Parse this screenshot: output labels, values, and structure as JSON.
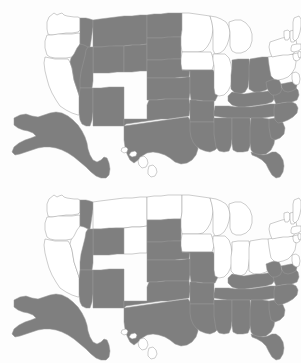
{
  "figure": {
    "type": "choropleth-pair",
    "title": "",
    "background_color": "#fdfdfd",
    "panel_count": 2
  },
  "colors": {
    "shaded": "#7f7f7f",
    "unshaded": "#ffffff",
    "border": "#9a9a9a",
    "background": "#fdfdfd"
  },
  "chart_data": {
    "type": "heatmap",
    "title": "",
    "subtitle": "",
    "xlabel": "",
    "ylabel": "",
    "legend": [],
    "annotations": [],
    "grid": false,
    "maps": [
      {
        "panel": "top",
        "label": "",
        "value_scale": [
          "unshaded",
          "shaded"
        ],
        "shaded_count": 32,
        "unshaded_count": 18,
        "states": {
          "AL": 1,
          "AK": 1,
          "AZ": 1,
          "AR": 1,
          "CA": 0,
          "CO": 1,
          "CT": 0,
          "DE": 0,
          "FL": 1,
          "GA": 1,
          "HI": 0,
          "ID": 1,
          "IL": 0,
          "IN": 1,
          "IA": 0,
          "KS": 1,
          "KY": 1,
          "LA": 1,
          "ME": 0,
          "MD": 1,
          "MA": 0,
          "MI": 0,
          "MN": 0,
          "MS": 1,
          "MO": 1,
          "MT": 1,
          "NE": 1,
          "NV": 1,
          "NH": 0,
          "NJ": 0,
          "NM": 1,
          "NY": 0,
          "NC": 1,
          "ND": 1,
          "OH": 1,
          "OK": 1,
          "OR": 0,
          "PA": 0,
          "RI": 0,
          "SC": 1,
          "SD": 1,
          "TN": 1,
          "TX": 1,
          "UT": 1,
          "VT": 0,
          "VA": 1,
          "WA": 0,
          "WV": 1,
          "WI": 0,
          "WY": 1
        }
      },
      {
        "panel": "bottom",
        "label": "",
        "value_scale": [
          "unshaded",
          "shaded"
        ],
        "shaded_count": 25,
        "unshaded_count": 25,
        "states": {
          "AL": 1,
          "AK": 1,
          "AZ": 1,
          "AR": 1,
          "CA": 0,
          "CO": 0,
          "CT": 0,
          "DE": 1,
          "FL": 1,
          "GA": 1,
          "HI": 0,
          "ID": 1,
          "IL": 0,
          "IN": 0,
          "IA": 0,
          "KS": 1,
          "KY": 1,
          "LA": 1,
          "ME": 0,
          "MD": 1,
          "MA": 0,
          "MI": 0,
          "MN": 0,
          "MS": 1,
          "MO": 1,
          "MT": 0,
          "NE": 1,
          "NV": 0,
          "NH": 0,
          "NJ": 0,
          "NM": 1,
          "NY": 0,
          "NC": 1,
          "ND": 0,
          "OH": 0,
          "OK": 1,
          "OR": 0,
          "PA": 0,
          "RI": 0,
          "SC": 1,
          "SD": 1,
          "TN": 1,
          "TX": 1,
          "UT": 1,
          "VT": 0,
          "VA": 1,
          "WA": 0,
          "WV": 1,
          "WI": 0,
          "WY": 1
        }
      }
    ]
  },
  "geometry": {
    "note": "simplified polygon outlines in 301x181 panel coordinates",
    "states": {
      "WA": "49,17 54,13 57,15 59,14 62,13 64,15 67,16 74,17 78,17 80,18 80,30 78,32 72,33 66,33 60,34 54,35 50,35 48,34 47,29 47,22",
      "OR": "47,35 52,35 58,34 65,34 72,34 79,33 80,34 80,44 78,50 76,55 72,57 66,58 60,58 55,58 50,57 47,55 45,48 45,41",
      "CA": "45,57 50,58 55,59 60,59 64,59 68,59 70,62 72,68 73,74 74,80 76,86 78,92 80,98 82,104 84,110 82,114 78,115 72,113 66,110 60,106 56,100 52,93 49,86 47,79 45,71 44,63",
      "ID": "80,18 86,18 90,19 93,20 93,27 92,34 91,41 90,47 89,53 88,58 86,62 83,62 81,58 80,52 80,44 80,34 80,30",
      "NV": "80,44 84,45 88,47 92,49 95,51 93,58 91,65 89,72 87,79 85,86 83,92 82,98 80,98 78,92 76,86 74,80 73,74 72,68 70,62 71,58 74,54 77,48",
      "MT": "93,20 100,19 108,18 116,17 124,16 132,16 140,15 147,15 147,25 147,35 147,44 140,45 132,45 124,46 116,46 108,47 100,47 93,47 93,34 93,27",
      "WY": "93,47 101,47 109,46 117,46 124,46 124,55 124,64 124,72 117,72 109,73 101,73 93,73 93,65 93,56",
      "UT": "88,47 93,47 93,56 93,65 93,73 93,81 92,88 88,88 84,88 80,88 80,80 81,72 83,64 85,56 86,50",
      "CO": "124,46 132,45 140,45 147,44 147,53 147,62 147,71 140,71 132,72 124,72 124,64 124,55",
      "AZ": "80,88 85,88 90,88 93,88 93,96 93,104 93,112 92,120 90,126 86,126 82,124 80,120 79,113 79,105 79,97",
      "NM": "93,88 101,88 109,87 117,87 124,87 124,95 124,103 124,111 124,119 124,126 117,126 109,126 101,126 93,126 93,118 93,110 93,100",
      "ND": "147,15 154,14 161,14 168,13 175,13 182,13 182,22 182,30 181,37 174,37 167,38 160,38 154,38 147,38 147,30 147,22",
      "SD": "147,38 154,38 161,38 168,37 175,37 181,37 181,45 181,52 181,59 174,59 167,60 160,60 153,60 147,60 147,52 147,45",
      "NE": "147,60 154,60 161,60 168,59 175,59 181,59 184,61 187,63 190,65 190,71 189,77 182,77 175,78 168,78 161,78 154,78 147,78 147,70",
      "KS": "147,78 155,78 163,78 171,78 179,78 187,77 190,77 190,85 190,93 189,99 181,99 173,99 165,99 157,100 149,100 147,100 147,92 147,85",
      "OK": "124,119 131,119 138,119 145,119 147,119 147,110 147,105 149,100 157,100 165,99 173,99 181,99 189,99 190,104 190,110 189,116 182,117 175,118 168,119 161,119 154,120 147,121 140,122 133,123 126,124 124,126",
      "TX": "124,126 131,125 138,124 145,123 152,122 159,121 166,120 173,119 180,118 188,117 191,121 193,128 195,135 197,142 198,149 196,155 192,160 187,163 181,164 175,162 170,158 165,155 159,153 153,152 147,153 142,156 138,160 134,163 130,160 127,154 125,147 124,140 124,133",
      "MN": "182,13 189,13 196,14 203,15 210,16 212,22 213,29 212,36 210,42 207,47 203,51 198,52 193,52 188,52 182,52 181,45 181,37 182,30 182,22",
      "IA": "182,52 188,52 194,52 200,52 206,52 211,52 213,58 214,64 212,70 206,70 200,70 194,70 188,70 182,70 181,64 181,59",
      "MO": "182,70 188,70 194,70 200,70 207,70 213,70 216,75 218,81 219,88 218,95 215,101 209,101 203,101 197,100 191,100 190,93 190,85 190,77 190,71",
      "AR": "190,100 196,100 202,101 208,101 214,101 214,108 214,115 214,122 208,122 202,122 196,122 190,122 190,115 190,108",
      "LA": "190,122 196,122 202,122 208,122 214,122 216,128 218,134 220,140 219,146 215,150 210,152 205,151 200,149 196,146 193,142 191,137 190,131",
      "WI": "210,16 216,17 221,19 226,22 229,27 230,33 229,39 227,45 224,50 220,53 215,54 213,50 213,44 213,37 213,30 212,23",
      "IL": "213,54 219,54 225,54 229,58 231,64 232,71 232,78 231,85 228,91 224,95 219,96 215,94 214,88 214,81 214,74 214,66 213,60",
      "MI": "229,22 235,20 241,20 246,23 250,28 252,34 252,41 250,47 246,51 241,53 236,53 232,51 230,46 230,39 230,32 229,27",
      "IN": "232,60 238,59 244,59 249,59 250,66 250,73 249,80 248,87 245,92 240,94 235,93 231,89 231,82 231,75 232,68",
      "OH": "250,59 256,58 262,57 268,57 272,60 274,66 275,73 274,80 271,86 266,90 260,92 254,92 249,89 249,81 249,73 249,66",
      "KY": "232,92 238,93 244,94 250,93 256,92 262,92 268,91 273,93 275,98 272,102 266,104 259,105 252,106 245,107 238,107 232,105 228,101 228,96",
      "TN": "215,106 222,106 229,106 236,107 243,107 250,107 257,106 264,105 270,104 275,104 276,110 275,116 269,117 262,118 255,118 248,118 241,118 234,118 227,118 220,117 214,116 214,111",
      "MS": "214,118 220,118 226,118 232,118 232,125 232,132 232,139 231,146 229,151 224,152 219,151 216,147 215,141 214,134 214,126",
      "AL": "232,118 238,118 244,118 250,118 251,125 251,132 251,139 250,146 248,151 243,152 237,152 233,150 232,144 232,137 232,130 232,124",
      "GA": "251,118 257,118 263,118 269,119 272,124 274,130 275,137 274,144 271,150 266,154 260,155 254,154 251,150 250,143 250,136 250,128",
      "FL": "251,152 257,154 263,155 268,154 272,152 276,152 280,155 283,160 284,166 283,172 280,177 276,178 272,175 269,170 266,164 262,160 257,157 252,155",
      "SC": "269,119 275,118 280,119 283,123 285,128 284,134 280,138 275,140 271,138 270,133 269,127",
      "NC": "275,104 281,103 287,102 292,102 296,104 298,108 297,113 293,117 288,120 283,122 278,123 275,120 274,114 274,109",
      "VA": "272,90 278,89 284,88 290,87 295,87 298,90 299,95 297,100 292,102 287,102 281,103 276,104 274,99 273,94",
      "WV": "266,82 271,80 275,79 279,80 281,84 282,89 280,93 276,95 272,95 269,92 267,88",
      "MD": "281,84 286,83 291,82 295,82 297,85 296,89 292,91 288,92 284,91 282,88",
      "DE": "293,78 296,77 298,79 298,83 296,85 294,84 293,81",
      "PA": "268,57 274,56 280,55 286,54 292,54 295,57 296,62 295,68 292,73 288,77 283,79 278,80 274,79 271,76 270,71 269,65",
      "NJ": "292,73 296,72 299,74 300,79 299,84 296,85 293,83 292,79",
      "NY": "270,42 276,40 282,38 288,37 293,37 296,40 297,45 296,50 293,54 288,55 283,55 277,56 272,57 270,52 269,47",
      "CT": "293,54 297,53 300,54 300,59 297,61 294,60 293,57",
      "RI": "298,52 300,51 301,53 301,57 299,58 298,55",
      "MA": "292,45 297,44 301,44 301,49 298,51 294,52 291,51 291,48",
      "VT": "284,31 288,30 290,32 290,37 288,40 285,40 284,36",
      "NH": "290,31 294,30 296,33 296,39 294,42 291,42 290,38 290,34",
      "ME": "294,18 299,16 301,19 301,26 300,32 298,38 295,41 293,39 293,33 293,27 293,22",
      "AK": "14,118 20,115 26,114 32,116 38,117 44,115 50,113 56,112 62,113 68,116 73,120 78,125 82,131 85,137 87,143 88,149 90,155 93,160 97,162 101,160 104,157 107,158 109,163 110,169 109,175 106,178 101,178 96,176 91,172 86,167 80,162 74,157 68,153 62,150 56,148 50,147 44,147 38,148 32,150 26,152 20,154 15,155 12,152 14,147 19,143 25,140 31,138 36,136 33,133 28,131 23,130 18,128 14,125",
      "HI": "122,148 126,147 128,149 127,152 124,153 121,151 / 131,152 135,151 137,153 136,156 132,157 129,155 / 140,157 144,156 147,159 148,163 146,167 142,168 139,165 138,161 / 149,166 153,165 156,168 157,172 155,176 151,177 148,174 148,170"
    }
  }
}
